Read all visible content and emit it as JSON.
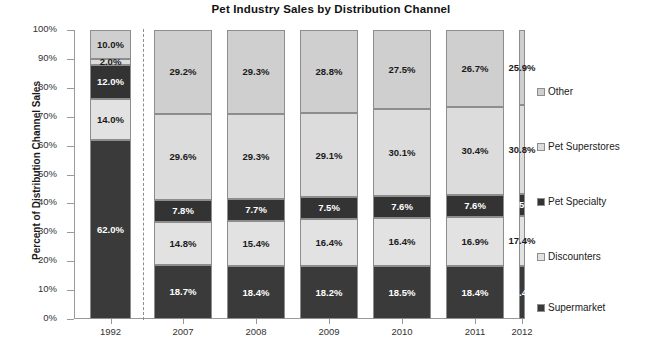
{
  "chart_data": {
    "type": "bar",
    "subtype": "stacked-100-percent-column",
    "title": "Pet Industry Sales by Distribution Channel",
    "xlabel": "",
    "ylabel": "Percent of Distribution Channel Sales",
    "ylim": [
      0,
      100
    ],
    "ytick_labels": [
      "0%",
      "10%",
      "20%",
      "30%",
      "40%",
      "50%",
      "60%",
      "70%",
      "80%",
      "90%",
      "100%"
    ],
    "ytick_values": [
      0,
      10,
      20,
      30,
      40,
      50,
      60,
      70,
      80,
      90,
      100
    ],
    "grid": false,
    "legend_position": "right",
    "categories": [
      "1992",
      "2007",
      "2008",
      "2009",
      "2010",
      "2011",
      "2012"
    ],
    "series": [
      {
        "name": "Supermarket",
        "color": "#3a3a3a",
        "label_color": "light",
        "values": [
          62.0,
          18.7,
          18.4,
          18.2,
          18.5,
          18.4,
          18.4
        ],
        "labels": [
          "62.0%",
          "18.7%",
          "18.4%",
          "18.2%",
          "18.5%",
          "18.4%",
          "18.4%"
        ]
      },
      {
        "name": "Discounters",
        "color": "#e2e2e2",
        "label_color": "dark",
        "values": [
          14.0,
          14.8,
          15.4,
          16.4,
          16.4,
          16.9,
          17.4
        ],
        "labels": [
          "14.0%",
          "14.8%",
          "15.4%",
          "16.4%",
          "16.4%",
          "16.9%",
          "17.4%"
        ]
      },
      {
        "name": "Pet Specialty",
        "color": "#333333",
        "label_color": "light",
        "values": [
          12.0,
          7.8,
          7.7,
          7.5,
          7.6,
          7.6,
          7.5
        ],
        "labels": [
          "12.0%",
          "7.8%",
          "7.7%",
          "7.5%",
          "7.6%",
          "7.6%",
          "7.5%"
        ]
      },
      {
        "name": "Pet Superstores",
        "color": "#dcdcdc",
        "label_color": "dark",
        "values": [
          2.0,
          29.6,
          29.3,
          29.1,
          30.1,
          30.4,
          30.8
        ],
        "labels": [
          "2.0%",
          "29.6%",
          "29.3%",
          "29.1%",
          "30.1%",
          "30.4%",
          "30.8%"
        ]
      },
      {
        "name": "Other",
        "color": "#cfcfcf",
        "label_color": "dark",
        "values": [
          10.0,
          29.2,
          29.3,
          28.8,
          27.5,
          26.7,
          25.9
        ],
        "labels": [
          "10.0%",
          "29.2%",
          "29.3%",
          "28.8%",
          "27.5%",
          "26.7%",
          "25.9%"
        ]
      }
    ],
    "annotations": [
      {
        "name": "separator",
        "type": "vertical-dashed-line",
        "after_category": "1992"
      }
    ]
  },
  "legend": {
    "items": [
      {
        "label": "Other",
        "color": "#cfcfcf",
        "top": 56
      },
      {
        "label": "Pet Superstores",
        "color": "#dcdcdc",
        "top": 111
      },
      {
        "label": "Pet Specialty",
        "color": "#333333",
        "top": 166
      },
      {
        "label": "Discounters",
        "color": "#e2e2e2",
        "top": 221
      },
      {
        "label": "Supermarket",
        "color": "#3a3a3a",
        "top": 272
      }
    ]
  }
}
